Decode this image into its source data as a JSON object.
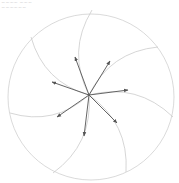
{
  "caption": {
    "line1": "~~~~ ~~~",
    "line2": "~~~~~~"
  },
  "diagram": {
    "type": "spiral-vector-field",
    "circle": {
      "cx": 91,
      "cy": 97,
      "r": 83,
      "stroke": "#d0d0d0"
    },
    "center": {
      "x": 89,
      "y": 95
    },
    "arms": [
      {
        "end": [
          92,
          10
        ]
      },
      {
        "end": [
          158,
          47
        ]
      },
      {
        "end": [
          173,
          117
        ]
      },
      {
        "end": [
          126,
          172
        ]
      },
      {
        "end": [
          53,
          173
        ]
      },
      {
        "end": [
          10,
          113
        ]
      },
      {
        "end": [
          31,
          37
        ]
      }
    ],
    "arrows": [
      {
        "end": [
          75,
          57
        ]
      },
      {
        "end": [
          110,
          61
        ]
      },
      {
        "end": [
          52,
          82
        ]
      },
      {
        "end": [
          128,
          90
        ]
      },
      {
        "end": [
          57,
          117
        ]
      },
      {
        "end": [
          84,
          136
        ]
      },
      {
        "end": [
          117,
          123
        ]
      }
    ],
    "arm_color": "#cccccc",
    "arrow_color": "#555555"
  }
}
